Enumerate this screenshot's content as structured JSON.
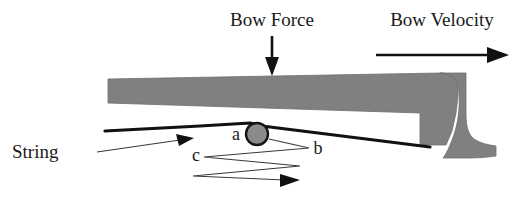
{
  "figure": {
    "background_color": "#ffffff",
    "width": 524,
    "height": 197
  },
  "labels": {
    "bow_force": "Bow Force",
    "bow_velocity": "Bow Velocity",
    "string": "String",
    "point_a": "a",
    "point_b": "b",
    "point_c": "c"
  },
  "colors": {
    "bow_gray": "#808080",
    "line_black": "#111111",
    "leader_gray": "#3a3a3a",
    "disk_gray": "#8a8a8a",
    "text": "#1a1a1a"
  },
  "elements": {
    "bow_force_arrow": {
      "icon": "arrow-down-icon",
      "direction": "down",
      "from_x": 272,
      "from_y": 36,
      "to_x": 272,
      "to_y": 74
    },
    "bow_velocity_arrow": {
      "icon": "arrow-right-icon",
      "direction": "right",
      "from_x": 376,
      "from_y": 55,
      "to_x": 508,
      "to_y": 55
    },
    "string_leader_arrow": {
      "icon": "leader-arrow-icon",
      "direction": "right",
      "from_x": 97,
      "from_y": 151,
      "to_x": 193,
      "to_y": 138
    },
    "contact_disk": {
      "icon": "contact-point-icon",
      "center_x": 257,
      "center_y": 134,
      "radius": 11
    },
    "zigzag_arrow": {
      "icon": "zigzag-arrow-icon",
      "direction": "right",
      "end_x": 298,
      "end_y": 180
    },
    "bow_stick": {
      "icon": "bow-stick-shape",
      "left_x": 108,
      "right_x": 516
    }
  }
}
